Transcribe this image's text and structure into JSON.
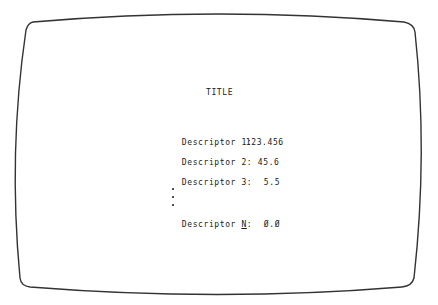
{
  "screen": {
    "title": "TITLE",
    "descriptors": [
      {
        "label_prefix": "Descriptor ",
        "label_index": "1",
        "label_suffix": ":",
        "value": "123.456"
      },
      {
        "label_prefix": "Descriptor ",
        "label_index": "2",
        "label_suffix": ":",
        "value": "45.6"
      },
      {
        "label_prefix": "Descriptor ",
        "label_index": "3",
        "label_suffix": ":",
        "value": "5.5"
      },
      {
        "label_prefix": "Descriptor ",
        "label_index": "N",
        "label_suffix": ":",
        "value": "Ø.Ø"
      }
    ],
    "ellipsis": "⋮",
    "colors": {
      "text": "#1a1a1a",
      "frame": "#333333",
      "background": "#ffffff"
    }
  }
}
